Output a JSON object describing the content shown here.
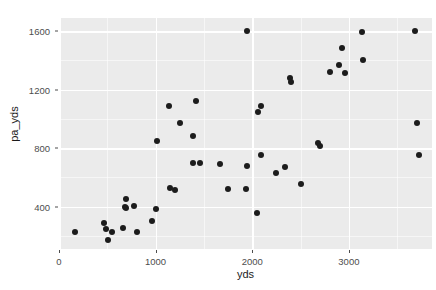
{
  "chart_data": {
    "type": "scatter",
    "title": "",
    "xlabel": "yds",
    "ylabel": "pa_yds",
    "xlim": [
      0,
      3860
    ],
    "ylim": [
      110,
      1690
    ],
    "xticks": [
      0,
      1000,
      2000,
      3000
    ],
    "yticks": [
      400,
      800,
      1200,
      1600
    ],
    "xtick_labels": [
      "0",
      "1000",
      "2000",
      "3000"
    ],
    "ytick_labels": [
      "400",
      "800",
      "1200",
      "1600"
    ],
    "grid": true,
    "legend": false,
    "point_color": "#1c1c1c",
    "panel_color": "#ebebeb",
    "grid_color": "#ffffff",
    "points": [
      {
        "x": 170,
        "y": 225
      },
      {
        "x": 460,
        "y": 290
      },
      {
        "x": 490,
        "y": 245
      },
      {
        "x": 510,
        "y": 175
      },
      {
        "x": 545,
        "y": 230
      },
      {
        "x": 660,
        "y": 255
      },
      {
        "x": 680,
        "y": 400
      },
      {
        "x": 690,
        "y": 455
      },
      {
        "x": 695,
        "y": 390
      },
      {
        "x": 775,
        "y": 405
      },
      {
        "x": 805,
        "y": 230
      },
      {
        "x": 965,
        "y": 305
      },
      {
        "x": 1005,
        "y": 385
      },
      {
        "x": 1010,
        "y": 850
      },
      {
        "x": 1140,
        "y": 1090
      },
      {
        "x": 1150,
        "y": 525
      },
      {
        "x": 1200,
        "y": 515
      },
      {
        "x": 1255,
        "y": 975
      },
      {
        "x": 1385,
        "y": 880
      },
      {
        "x": 1390,
        "y": 700
      },
      {
        "x": 1420,
        "y": 1125
      },
      {
        "x": 1455,
        "y": 700
      },
      {
        "x": 1665,
        "y": 690
      },
      {
        "x": 1745,
        "y": 520
      },
      {
        "x": 1950,
        "y": 1600
      },
      {
        "x": 1930,
        "y": 520
      },
      {
        "x": 1945,
        "y": 675
      },
      {
        "x": 2050,
        "y": 355
      },
      {
        "x": 2055,
        "y": 1045
      },
      {
        "x": 2090,
        "y": 1090
      },
      {
        "x": 2095,
        "y": 755
      },
      {
        "x": 2250,
        "y": 630
      },
      {
        "x": 2335,
        "y": 670
      },
      {
        "x": 2385,
        "y": 1280
      },
      {
        "x": 2400,
        "y": 1255
      },
      {
        "x": 2505,
        "y": 555
      },
      {
        "x": 2680,
        "y": 835
      },
      {
        "x": 2700,
        "y": 815
      },
      {
        "x": 2800,
        "y": 1320
      },
      {
        "x": 2895,
        "y": 1370
      },
      {
        "x": 2930,
        "y": 1485
      },
      {
        "x": 2955,
        "y": 1315
      },
      {
        "x": 3140,
        "y": 1595
      },
      {
        "x": 3150,
        "y": 1400
      },
      {
        "x": 3680,
        "y": 1600
      },
      {
        "x": 3700,
        "y": 975
      },
      {
        "x": 3720,
        "y": 750
      }
    ]
  }
}
